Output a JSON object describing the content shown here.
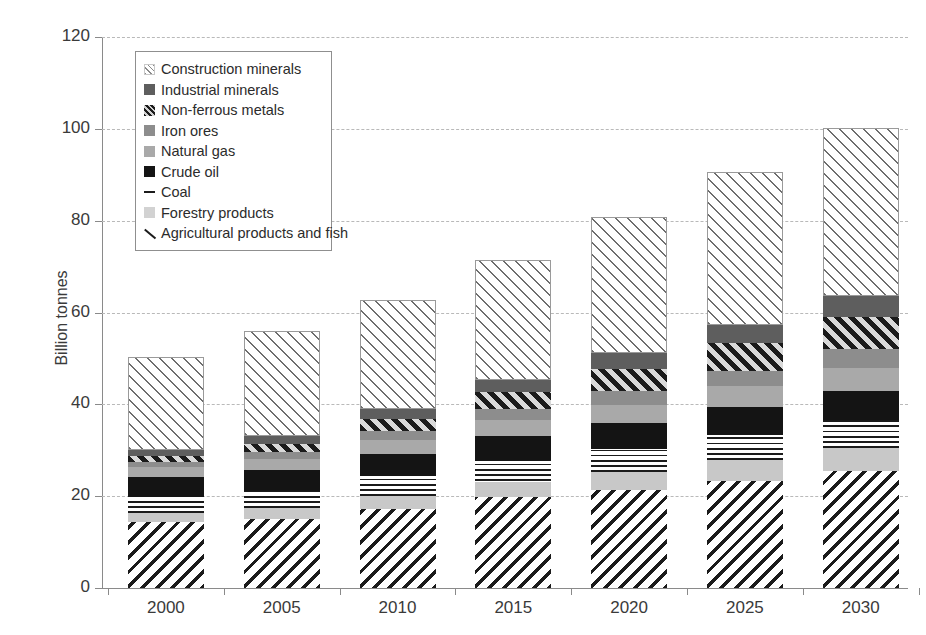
{
  "chart_data": {
    "type": "bar",
    "subtype": "stacked-bar",
    "title": "",
    "xlabel": "",
    "ylabel": "Billion tonnes",
    "ylim": [
      0,
      120
    ],
    "ytick_step": 20,
    "ytick_labels": [
      "0",
      "20",
      "40",
      "60",
      "80",
      "100",
      "120"
    ],
    "grid": true,
    "grid_axis": "y",
    "grid_style": "dashed",
    "legend_position": "upper-left-inside",
    "categories": [
      "2000",
      "2005",
      "2010",
      "2015",
      "2020",
      "2025",
      "2030"
    ],
    "stack_order_bottom_to_top": [
      "Agricultural products and fish",
      "Forestry products",
      "Coal",
      "Crude oil",
      "Natural gas",
      "Iron ores",
      "Non-ferrous metals",
      "Industrial minerals",
      "Construction minerals"
    ],
    "series": [
      {
        "name": "Agricultural products and fish",
        "pattern": "diagonal-hatch-backward",
        "color": "#1b1b1b",
        "values": [
          14.3,
          15.0,
          17.3,
          19.9,
          21.4,
          23.4,
          25.5
        ]
      },
      {
        "name": "Forestry products",
        "pattern": "solid-light-gray",
        "color": "#c8c8c8",
        "values": [
          2.0,
          2.4,
          2.8,
          3.3,
          3.8,
          4.4,
          5.0
        ]
      },
      {
        "name": "Coal",
        "pattern": "horizontal-lines",
        "color": "#1b1b1b",
        "values": [
          3.5,
          3.7,
          4.2,
          4.5,
          5.0,
          5.5,
          6.0
        ]
      },
      {
        "name": "Crude oil",
        "pattern": "solid-black",
        "color": "#141414",
        "values": [
          4.3,
          4.5,
          4.9,
          5.3,
          5.7,
          6.1,
          6.5
        ]
      },
      {
        "name": "Natural gas",
        "pattern": "solid-mid-gray",
        "color": "#a9a9a9",
        "values": [
          2.2,
          2.5,
          3.0,
          3.5,
          4.0,
          4.5,
          5.0
        ]
      },
      {
        "name": "Iron ores",
        "pattern": "solid-gray",
        "color": "#8d8d8d",
        "values": [
          1.2,
          1.5,
          1.9,
          2.4,
          2.9,
          3.4,
          4.0
        ]
      },
      {
        "name": "Non-ferrous metals",
        "pattern": "diagonal-hatch-forward-dark",
        "color": "#1b1b1b",
        "values": [
          1.3,
          1.8,
          2.7,
          3.7,
          4.9,
          6.0,
          7.0
        ]
      },
      {
        "name": "Industrial minerals",
        "pattern": "solid-dark-gray",
        "color": "#5e5e5e",
        "values": [
          1.3,
          1.6,
          2.1,
          2.7,
          3.4,
          4.0,
          4.5
        ]
      },
      {
        "name": "Construction minerals",
        "pattern": "diagonal-hatch-forward-light",
        "color": "#6e6e6e",
        "values": [
          20.2,
          22.9,
          23.8,
          26.1,
          29.8,
          33.2,
          36.7
        ]
      }
    ],
    "totals": [
      50.3,
      56.0,
      62.7,
      71.4,
      80.9,
      90.5,
      100.2
    ]
  },
  "axis": {
    "y_label": "Billion tonnes",
    "y_ticks": [
      "120",
      "100",
      "80",
      "60",
      "40",
      "20",
      "0"
    ],
    "x_ticks": [
      "2000",
      "2005",
      "2010",
      "2015",
      "2020",
      "2025",
      "2030"
    ]
  },
  "legend": {
    "items": [
      {
        "label": "Construction minerals",
        "swatch": "construction-minerals-swatch"
      },
      {
        "label": "Industrial minerals",
        "swatch": "industrial-minerals-swatch"
      },
      {
        "label": "Non-ferrous metals",
        "swatch": "non-ferrous-metals-swatch"
      },
      {
        "label": "Iron ores",
        "swatch": "iron-ores-swatch"
      },
      {
        "label": "Natural gas",
        "swatch": "natural-gas-swatch"
      },
      {
        "label": "Crude oil",
        "swatch": "crude-oil-swatch"
      },
      {
        "label": "Coal",
        "swatch": "coal-swatch"
      },
      {
        "label": "Forestry products",
        "swatch": "forestry-products-swatch"
      },
      {
        "label": "Agricultural products and fish",
        "swatch": "agricultural-products-and-fish-swatch"
      }
    ]
  },
  "colors": {
    "construction_minerals": "#6e6e6e",
    "industrial_minerals": "#5e5e5e",
    "non_ferrous_metals": "#1b1b1b",
    "iron_ores": "#8d8d8d",
    "natural_gas": "#a9a9a9",
    "crude_oil": "#141414",
    "coal": "#1b1b1b",
    "forestry_products": "#c8c8c8",
    "agricultural_products": "#1b1b1b",
    "gridline": "#b9b9b9",
    "axis": "#8a8a8a",
    "text": "#2b2b2b",
    "background": "#ffffff"
  }
}
